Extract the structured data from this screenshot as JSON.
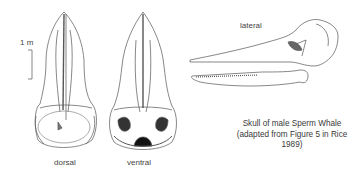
{
  "figure": {
    "scale_label": "1 m",
    "views": {
      "dorsal": "dorsal",
      "ventral": "ventral",
      "lateral": "lateral"
    },
    "caption": {
      "line1": "Skull of male Sperm Whale",
      "line2": "(adapted from Figure 5 in Rice 1989)"
    }
  }
}
